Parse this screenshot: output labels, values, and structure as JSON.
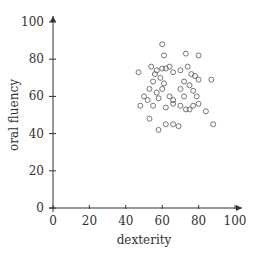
{
  "chart_data": {
    "type": "scatter",
    "title": "",
    "xlabel": "dexterity",
    "ylabel": "oral fluency",
    "xlim": [
      0,
      100
    ],
    "ylim": [
      0,
      100
    ],
    "xticks": [
      0,
      20,
      40,
      60,
      80,
      100
    ],
    "yticks": [
      0,
      20,
      40,
      60,
      80,
      100
    ],
    "grid": false,
    "legend": null,
    "marker": "open-circle",
    "color": "#666666",
    "points": [
      {
        "x": 60,
        "y": 88
      },
      {
        "x": 61,
        "y": 82
      },
      {
        "x": 73,
        "y": 83
      },
      {
        "x": 80,
        "y": 82
      },
      {
        "x": 54,
        "y": 76
      },
      {
        "x": 47,
        "y": 73
      },
      {
        "x": 57,
        "y": 74
      },
      {
        "x": 60,
        "y": 75
      },
      {
        "x": 62,
        "y": 75
      },
      {
        "x": 64,
        "y": 76
      },
      {
        "x": 66,
        "y": 73
      },
      {
        "x": 70,
        "y": 74
      },
      {
        "x": 74,
        "y": 76
      },
      {
        "x": 76,
        "y": 72
      },
      {
        "x": 78,
        "y": 71
      },
      {
        "x": 80,
        "y": 69
      },
      {
        "x": 87,
        "y": 69
      },
      {
        "x": 56,
        "y": 72
      },
      {
        "x": 59,
        "y": 70
      },
      {
        "x": 61,
        "y": 67
      },
      {
        "x": 55,
        "y": 68
      },
      {
        "x": 53,
        "y": 64
      },
      {
        "x": 57,
        "y": 62
      },
      {
        "x": 60,
        "y": 64
      },
      {
        "x": 64,
        "y": 60
      },
      {
        "x": 66,
        "y": 56
      },
      {
        "x": 70,
        "y": 64
      },
      {
        "x": 72,
        "y": 60
      },
      {
        "x": 75,
        "y": 66
      },
      {
        "x": 77,
        "y": 63
      },
      {
        "x": 79,
        "y": 60
      },
      {
        "x": 72,
        "y": 68
      },
      {
        "x": 50,
        "y": 60
      },
      {
        "x": 52,
        "y": 58
      },
      {
        "x": 48,
        "y": 55
      },
      {
        "x": 55,
        "y": 55
      },
      {
        "x": 58,
        "y": 59
      },
      {
        "x": 62,
        "y": 54
      },
      {
        "x": 66,
        "y": 58
      },
      {
        "x": 70,
        "y": 55
      },
      {
        "x": 73,
        "y": 53
      },
      {
        "x": 77,
        "y": 55
      },
      {
        "x": 80,
        "y": 56
      },
      {
        "x": 84,
        "y": 52
      },
      {
        "x": 88,
        "y": 45
      },
      {
        "x": 53,
        "y": 48
      },
      {
        "x": 58,
        "y": 42
      },
      {
        "x": 62,
        "y": 45
      },
      {
        "x": 66,
        "y": 45
      },
      {
        "x": 69,
        "y": 44
      },
      {
        "x": 75,
        "y": 53
      }
    ]
  }
}
